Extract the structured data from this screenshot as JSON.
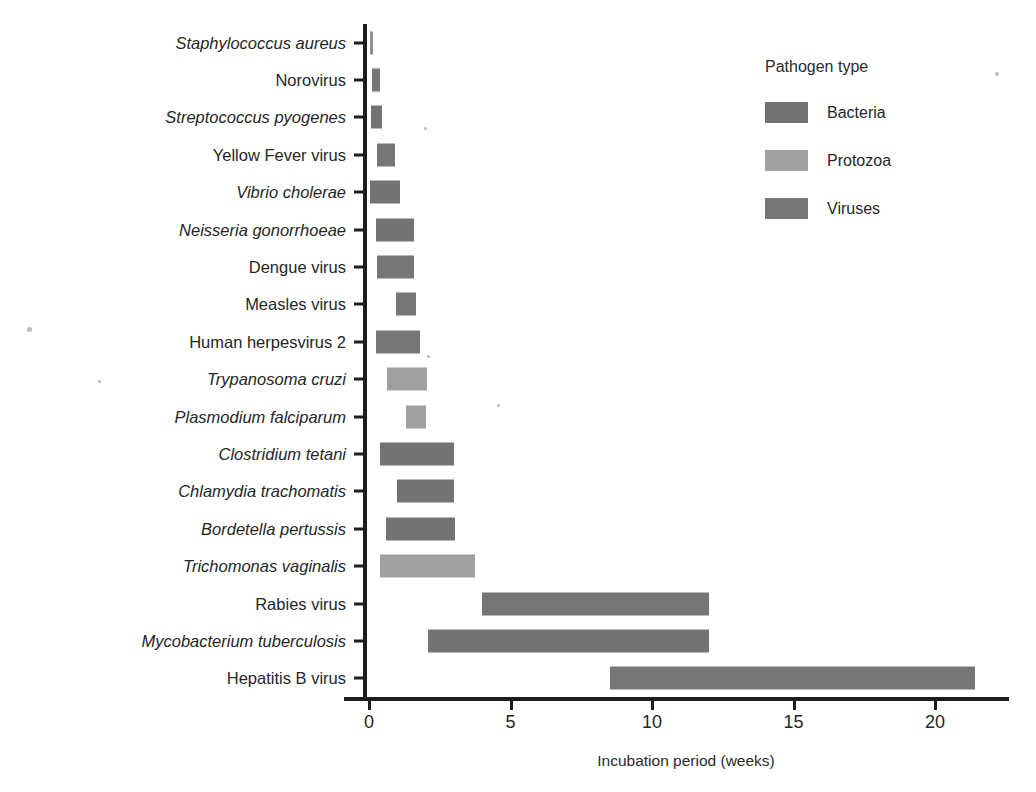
{
  "chart_data": {
    "type": "bar",
    "orientation": "horizontal",
    "bar_style": "range",
    "title": "",
    "xlabel": "Incubation period (weeks)",
    "ylabel": "Pathogen",
    "xlim": [
      0,
      22.5
    ],
    "xticks": [
      0,
      5,
      10,
      15,
      20
    ],
    "xtick_labels": [
      "0",
      "5",
      "10",
      "15",
      "20"
    ],
    "grid": false,
    "legend_position": "top-right",
    "legend_title": "Pathogen type",
    "legend_entries": [
      {
        "name": "Bacteria",
        "color": "#737373"
      },
      {
        "name": "Protozoa",
        "color": "#a0a0a0"
      },
      {
        "name": "Viruses",
        "color": "#767676"
      }
    ],
    "categories": [
      "Staphylococcus aureus",
      "Norovirus",
      "Streptococcus pyogenes",
      "Yellow Fever virus",
      "Vibrio cholerae",
      "Neisseria gonorrhoeae",
      "Dengue virus",
      "Measles virus",
      "Human herpesvirus 2",
      "Trypanosoma cruzi",
      "Plasmodium falciparum",
      "Clostridium tetani",
      "Chlamydia trachomatis",
      "Bordetella pertussis",
      "Trichomonas vaginalis",
      "Rabies virus",
      "Mycobacterium tuberculosis",
      "Hepatitis B virus"
    ],
    "bars": [
      {
        "category": "Staphylococcus aureus",
        "italic": true,
        "type": "Bacteria",
        "start": 0.05,
        "end": 0.15,
        "color": "#8f8f8f"
      },
      {
        "category": "Norovirus",
        "italic": false,
        "type": "Viruses",
        "start": 0.1,
        "end": 0.4,
        "color": "#767676"
      },
      {
        "category": "Streptococcus pyogenes",
        "italic": true,
        "type": "Bacteria",
        "start": 0.07,
        "end": 0.45,
        "color": "#737373"
      },
      {
        "category": "Yellow Fever virus",
        "italic": false,
        "type": "Viruses",
        "start": 0.3,
        "end": 0.92,
        "color": "#767676"
      },
      {
        "category": "Vibrio cholerae",
        "italic": true,
        "type": "Bacteria",
        "start": 0.05,
        "end": 1.1,
        "color": "#737373"
      },
      {
        "category": "Neisseria gonorrhoeae",
        "italic": true,
        "type": "Bacteria",
        "start": 0.25,
        "end": 1.6,
        "color": "#737373"
      },
      {
        "category": "Dengue virus",
        "italic": false,
        "type": "Viruses",
        "start": 0.3,
        "end": 1.6,
        "color": "#767676"
      },
      {
        "category": "Measles virus",
        "italic": false,
        "type": "Viruses",
        "start": 0.95,
        "end": 1.65,
        "color": "#767676"
      },
      {
        "category": "Human herpesvirus 2",
        "italic": false,
        "type": "Viruses",
        "start": 0.25,
        "end": 1.8,
        "color": "#767676"
      },
      {
        "category": "Trypanosoma cruzi",
        "italic": true,
        "type": "Protozoa",
        "start": 0.65,
        "end": 2.05,
        "color": "#a0a0a0"
      },
      {
        "category": "Plasmodium falciparum",
        "italic": true,
        "type": "Protozoa",
        "start": 1.3,
        "end": 2.0,
        "color": "#a0a0a0"
      },
      {
        "category": "Clostridium tetani",
        "italic": true,
        "type": "Bacteria",
        "start": 0.4,
        "end": 3.0,
        "color": "#737373"
      },
      {
        "category": "Chlamydia trachomatis",
        "italic": true,
        "type": "Bacteria",
        "start": 1.0,
        "end": 3.0,
        "color": "#737373"
      },
      {
        "category": "Bordetella pertussis",
        "italic": true,
        "type": "Bacteria",
        "start": 0.6,
        "end": 3.05,
        "color": "#737373"
      },
      {
        "category": "Trichomonas vaginalis",
        "italic": true,
        "type": "Protozoa",
        "start": 0.4,
        "end": 3.75,
        "color": "#a0a0a0"
      },
      {
        "category": "Rabies virus",
        "italic": false,
        "type": "Viruses",
        "start": 4.0,
        "end": 12.0,
        "color": "#767676"
      },
      {
        "category": "Mycobacterium tuberculosis",
        "italic": true,
        "type": "Bacteria",
        "start": 2.1,
        "end": 12.0,
        "color": "#737373"
      },
      {
        "category": "Hepatitis B virus",
        "italic": false,
        "type": "Viruses",
        "start": 8.5,
        "end": 21.4,
        "color": "#767676"
      }
    ]
  }
}
